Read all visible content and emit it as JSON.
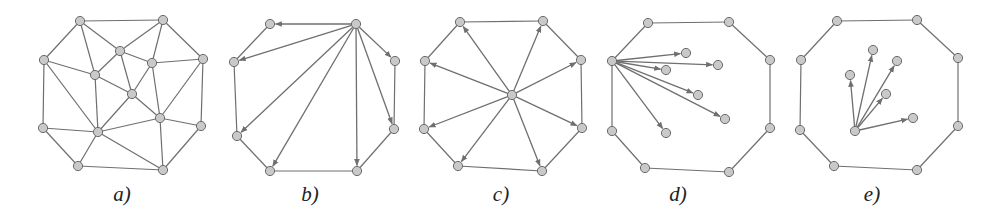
{
  "figure": {
    "colors": {
      "edge": "#6f6f6f",
      "node_fill": "#c9c9c9",
      "node_stroke": "#6a6a6a",
      "label": "#222222"
    },
    "panels": [
      {
        "id": "a",
        "label": "a)",
        "label_pos": [
          122,
          201
        ],
        "type": "triangulation",
        "nodes": [
          [
            80,
            21
          ],
          [
            163,
            20
          ],
          [
            44,
            60
          ],
          [
            203,
            59
          ],
          [
            43,
            128
          ],
          [
            201,
            126
          ],
          [
            78,
            166
          ],
          [
            163,
            170
          ],
          [
            120,
            51
          ],
          [
            152,
            63
          ],
          [
            95,
            75
          ],
          [
            132,
            94
          ],
          [
            160,
            118
          ],
          [
            98,
            132
          ]
        ],
        "edges": [
          [
            0,
            1
          ],
          [
            0,
            2
          ],
          [
            0,
            10
          ],
          [
            0,
            8
          ],
          [
            1,
            8
          ],
          [
            1,
            9
          ],
          [
            1,
            3
          ],
          [
            2,
            10
          ],
          [
            2,
            4
          ],
          [
            2,
            13
          ],
          [
            8,
            10
          ],
          [
            8,
            11
          ],
          [
            8,
            9
          ],
          [
            9,
            11
          ],
          [
            9,
            3
          ],
          [
            9,
            12
          ],
          [
            10,
            11
          ],
          [
            10,
            13
          ],
          [
            11,
            13
          ],
          [
            11,
            12
          ],
          [
            3,
            12
          ],
          [
            3,
            5
          ],
          [
            12,
            5
          ],
          [
            12,
            13
          ],
          [
            12,
            7
          ],
          [
            13,
            4
          ],
          [
            13,
            6
          ],
          [
            13,
            7
          ],
          [
            4,
            6
          ],
          [
            6,
            7
          ],
          [
            7,
            5
          ]
        ],
        "arrows": []
      },
      {
        "id": "b",
        "label": "b)",
        "label_pos": [
          310,
          201
        ],
        "type": "fan-from-boundary-vertex",
        "nodes": [
          [
            270,
            24
          ],
          [
            356,
            24
          ],
          [
            234,
            62
          ],
          [
            395,
            61
          ],
          [
            237,
            136
          ],
          [
            394,
            129
          ],
          [
            270,
            171
          ],
          [
            357,
            171
          ]
        ],
        "edges": [
          [
            0,
            2
          ],
          [
            2,
            4
          ],
          [
            4,
            6
          ],
          [
            6,
            7
          ],
          [
            7,
            5
          ],
          [
            5,
            3
          ]
        ],
        "arrows": [
          [
            1,
            0
          ],
          [
            1,
            2
          ],
          [
            1,
            4
          ],
          [
            1,
            6
          ],
          [
            1,
            7
          ],
          [
            1,
            5
          ],
          [
            1,
            3
          ]
        ]
      },
      {
        "id": "c",
        "label": "c)",
        "label_pos": [
          501,
          201
        ],
        "type": "star-from-center",
        "nodes": [
          [
            460,
            22
          ],
          [
            543,
            21
          ],
          [
            425,
            61
          ],
          [
            581,
            60
          ],
          [
            424,
            129
          ],
          [
            582,
            128
          ],
          [
            458,
            166
          ],
          [
            542,
            171
          ],
          [
            512,
            95
          ]
        ],
        "edges": [
          [
            0,
            1
          ],
          [
            0,
            2
          ],
          [
            2,
            4
          ],
          [
            4,
            6
          ],
          [
            6,
            7
          ],
          [
            7,
            5
          ],
          [
            5,
            3
          ],
          [
            3,
            1
          ]
        ],
        "arrows": [
          [
            8,
            0
          ],
          [
            8,
            1
          ],
          [
            8,
            2
          ],
          [
            8,
            3
          ],
          [
            8,
            4
          ],
          [
            8,
            5
          ],
          [
            8,
            6
          ],
          [
            8,
            7
          ]
        ]
      },
      {
        "id": "d",
        "label": "d)",
        "label_pos": [
          678,
          201
        ],
        "type": "fan-to-interior-points",
        "nodes": [
          [
            648,
            23
          ],
          [
            729,
            22
          ],
          [
            612,
            61
          ],
          [
            770,
            60
          ],
          [
            612,
            131
          ],
          [
            770,
            128
          ],
          [
            645,
            168
          ],
          [
            729,
            172
          ],
          [
            686,
            53
          ],
          [
            718,
            65
          ],
          [
            666,
            70
          ],
          [
            698,
            95
          ],
          [
            725,
            119
          ],
          [
            666,
            133
          ]
        ],
        "edges": [
          [
            0,
            1
          ],
          [
            0,
            2
          ],
          [
            2,
            4
          ],
          [
            4,
            6
          ],
          [
            6,
            7
          ],
          [
            7,
            5
          ],
          [
            5,
            3
          ],
          [
            3,
            1
          ]
        ],
        "arrows": [
          [
            2,
            8
          ],
          [
            2,
            9
          ],
          [
            2,
            10
          ],
          [
            2,
            11
          ],
          [
            2,
            12
          ],
          [
            2,
            13
          ]
        ]
      },
      {
        "id": "e",
        "label": "e)",
        "label_pos": [
          872,
          201
        ],
        "type": "fan-interior-source",
        "nodes": [
          [
            837,
            21
          ],
          [
            917,
            20
          ],
          [
            801,
            60
          ],
          [
            958,
            58
          ],
          [
            800,
            130
          ],
          [
            958,
            126
          ],
          [
            834,
            166
          ],
          [
            917,
            170
          ],
          [
            855,
            131
          ],
          [
            850,
            75
          ],
          [
            873,
            50
          ],
          [
            897,
            61
          ],
          [
            886,
            94
          ],
          [
            913,
            118
          ]
        ],
        "edges": [
          [
            0,
            1
          ],
          [
            0,
            2
          ],
          [
            2,
            4
          ],
          [
            4,
            6
          ],
          [
            6,
            7
          ],
          [
            7,
            5
          ],
          [
            5,
            3
          ],
          [
            3,
            1
          ]
        ],
        "arrows": [
          [
            8,
            9
          ],
          [
            8,
            10
          ],
          [
            8,
            11
          ],
          [
            8,
            12
          ],
          [
            8,
            13
          ]
        ]
      }
    ]
  }
}
